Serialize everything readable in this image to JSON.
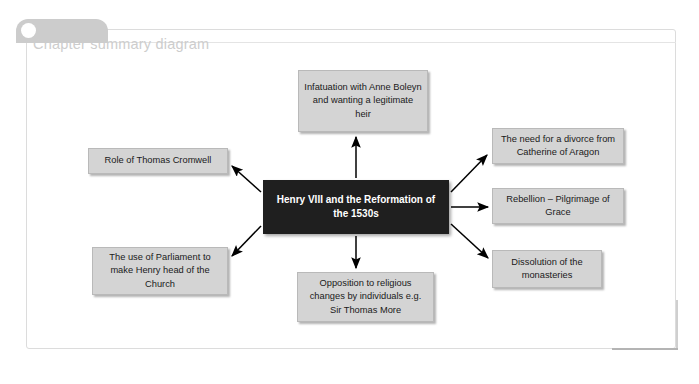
{
  "page": {
    "header": {
      "title": "Chapter summary diagram",
      "knob_icon": "circle-bullet-icon"
    },
    "accent_color": "#b4b4b4",
    "border_color": "#dcdcdc"
  },
  "diagram": {
    "type": "mind-map",
    "center": {
      "id": "center",
      "text": "Henry VIII and the Reformation of the 1530s",
      "line1": "Henry VIII and the",
      "line2": "Reformation of the 1530s",
      "fill": "#1f1f1f",
      "text_color": "#ffffff"
    },
    "node_fill": "#d4d4d4",
    "node_border": "#b9b9b9",
    "nodes": [
      {
        "id": "infatuation",
        "text": "Infatuation with Anne Boleyn and wanting a legitimate heir",
        "position": "top",
        "arrow": "up"
      },
      {
        "id": "divorce",
        "text": "The need for a divorce from Catherine of Aragon",
        "position": "right-top",
        "arrow": "up-right"
      },
      {
        "id": "rebellion",
        "text": "Rebellion – Pilgrimage of Grace",
        "position": "right-middle",
        "arrow": "right"
      },
      {
        "id": "dissolution",
        "text": "Dissolution of the monasteries",
        "position": "right-bottom",
        "arrow": "down-right"
      },
      {
        "id": "cromwell",
        "text": "Role of Thomas Cromwell",
        "position": "left-top",
        "arrow": "up-left"
      },
      {
        "id": "parliament",
        "text": "The use of Parliament to make Henry head of the Church",
        "position": "left-bottom",
        "arrow": "down-left"
      },
      {
        "id": "opposition",
        "text": "Opposition to religious changes by individuals e.g. Sir Thomas More",
        "position": "bottom",
        "arrow": "down"
      }
    ]
  }
}
